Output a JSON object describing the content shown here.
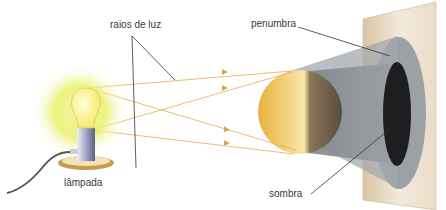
{
  "diagram": {
    "labels": {
      "rays": "raios de luz",
      "penumbra": "penumbra",
      "umbra": "sombra",
      "lamp": "lâmpada"
    },
    "components": [
      {
        "name": "lamp",
        "description": "glowing light bulb on a base with power cord"
      },
      {
        "name": "light-rays",
        "description": "four yellow lines with arrowheads from bulb toward sphere"
      },
      {
        "name": "sphere",
        "description": "opaque yellow sphere, lit on the left, shaded on the right"
      },
      {
        "name": "shadow-cone",
        "description": "grey cone projected from sphere onto screen"
      },
      {
        "name": "screen",
        "description": "beige vertical screen receiving the projection"
      },
      {
        "name": "penumbra-region",
        "description": "outer grey ellipse on screen"
      },
      {
        "name": "umbra-region",
        "description": "inner black ellipse on screen"
      }
    ],
    "colors": {
      "glow": "#eef27a",
      "bulb": "#f7f28a",
      "ray": "#e3b65a",
      "sphere_lit": "#f1c24a",
      "sphere_dark": "#6e5d46",
      "cone": "#8b9196",
      "screen": "#efe3cf",
      "penumbra": "#9a9fa4",
      "umbra": "#1d1c1e",
      "leader": "#333333"
    }
  }
}
